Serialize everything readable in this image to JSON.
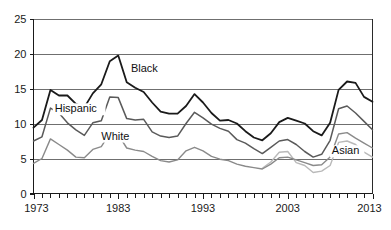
{
  "chart_data": {
    "type": "line",
    "title": "",
    "subtitle": "",
    "xlabel": "",
    "ylabel": "",
    "xlim": [
      1973,
      2013
    ],
    "ylim": [
      0,
      25
    ],
    "grid": true,
    "grid_axis": "y",
    "legend_position": "inline-annotations",
    "y_ticks": [
      0,
      5,
      10,
      15,
      20,
      25
    ],
    "y_tick_labels": [
      "0",
      "5",
      "10",
      "15",
      "20",
      "25"
    ],
    "x_ticks": [
      1973,
      1983,
      1993,
      2003,
      2013
    ],
    "x_tick_labels": [
      "1973",
      "1983",
      "1993",
      "2003",
      "2013"
    ],
    "x_minor_tick_interval": 1,
    "x": [
      1973,
      1974,
      1975,
      1976,
      1977,
      1978,
      1979,
      1980,
      1981,
      1982,
      1983,
      1984,
      1985,
      1986,
      1987,
      1988,
      1989,
      1990,
      1991,
      1992,
      1993,
      1994,
      1995,
      1996,
      1997,
      1998,
      1999,
      2000,
      2001,
      2002,
      2003,
      2004,
      2005,
      2006,
      2007,
      2008,
      2009,
      2010,
      2011,
      2012,
      2013
    ],
    "series": [
      {
        "name": "Black",
        "color": "#1a1a1a",
        "stroke_width": 1.8,
        "label": "Black",
        "label_x": 1984.5,
        "label_y": 17.4,
        "values": [
          9.4,
          10.5,
          14.8,
          14.0,
          14.0,
          12.8,
          12.3,
          14.3,
          15.6,
          18.9,
          19.7,
          15.9,
          15.1,
          14.5,
          13.0,
          11.7,
          11.4,
          11.4,
          12.5,
          14.2,
          13.0,
          11.5,
          10.4,
          10.5,
          10.0,
          8.9,
          8.0,
          7.6,
          8.6,
          10.2,
          10.8,
          10.4,
          10.0,
          8.9,
          8.3,
          10.1,
          14.8,
          16.0,
          15.8,
          13.8,
          13.1
        ]
      },
      {
        "name": "Hispanic",
        "color": "#5a5a5a",
        "stroke_width": 1.5,
        "label": "Hispanic",
        "label_x": 1975.5,
        "label_y": 11.6,
        "values": [
          7.5,
          8.1,
          12.2,
          11.5,
          10.1,
          9.1,
          8.3,
          10.1,
          10.4,
          13.8,
          13.7,
          10.7,
          10.5,
          10.6,
          8.8,
          8.2,
          8.0,
          8.2,
          10.0,
          11.6,
          10.8,
          9.9,
          9.3,
          8.9,
          7.7,
          7.2,
          6.4,
          5.7,
          6.6,
          7.5,
          7.7,
          7.0,
          6.0,
          5.2,
          5.6,
          7.6,
          12.1,
          12.5,
          11.5,
          10.3,
          9.1
        ]
      },
      {
        "name": "White",
        "color": "#8a8a8a",
        "stroke_width": 1.4,
        "label": "White",
        "label_x": 1981.0,
        "label_y": 7.7,
        "values": [
          4.3,
          5.0,
          7.8,
          7.0,
          6.2,
          5.2,
          5.1,
          6.3,
          6.7,
          8.6,
          8.4,
          6.5,
          6.2,
          6.0,
          5.3,
          4.7,
          4.5,
          4.8,
          6.1,
          6.6,
          6.1,
          5.3,
          4.9,
          4.7,
          4.2,
          3.9,
          3.7,
          3.5,
          4.2,
          5.1,
          5.2,
          4.8,
          4.4,
          4.0,
          4.1,
          5.2,
          8.5,
          8.7,
          7.9,
          7.2,
          6.5
        ]
      },
      {
        "name": "Asian",
        "color": "#b9b9b9",
        "stroke_width": 1.4,
        "label": "Asian",
        "label_x": 2008.2,
        "label_y": 5.6,
        "start_year": 2000,
        "values": [
          null,
          null,
          null,
          null,
          null,
          null,
          null,
          null,
          null,
          null,
          null,
          null,
          null,
          null,
          null,
          null,
          null,
          null,
          null,
          null,
          null,
          null,
          null,
          null,
          null,
          null,
          null,
          3.6,
          4.5,
          5.9,
          6.0,
          4.4,
          4.0,
          3.0,
          3.2,
          4.0,
          7.3,
          7.5,
          7.0,
          5.9,
          5.2
        ]
      }
    ]
  }
}
